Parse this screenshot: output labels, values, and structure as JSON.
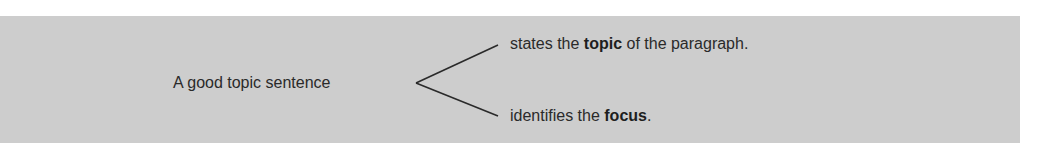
{
  "diagram": {
    "subject": "A good topic sentence",
    "branches": [
      {
        "pre": "states the ",
        "bold": "topic",
        "post": " of the paragraph."
      },
      {
        "pre": "identifies the ",
        "bold": "focus",
        "post": "."
      }
    ],
    "colors": {
      "panel": "#cdcdcd",
      "text": "#2a2a2a",
      "lines": "#2a2a2a"
    }
  }
}
